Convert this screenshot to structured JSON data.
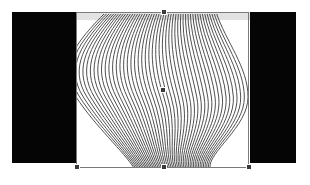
{
  "canvas": {
    "background": "#ffffff",
    "left_panel": {
      "color": "#050505"
    },
    "right_panel": {
      "color": "#050505"
    },
    "artboard": {
      "background": "#ffffff",
      "top_band_color": "#e2e2e2"
    },
    "artwork": {
      "type": "curved-line-pattern",
      "stroke_color": "#3c3c3c",
      "line_count": 48
    },
    "selection": {
      "border_color": "#7a7a7a",
      "handle_color": "#3a3a3a",
      "handles": [
        "top-center",
        "bottom-left",
        "bottom-center",
        "bottom-right",
        "center"
      ]
    }
  }
}
